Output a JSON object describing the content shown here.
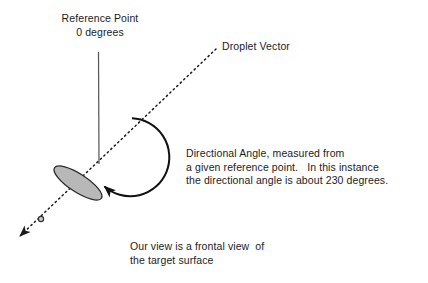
{
  "figure": {
    "title_text_blocks": {
      "reference_point": "Reference Point\n0 degrees",
      "droplet_vector": "Droplet Vector",
      "directional_angle": "Directional Angle, measured from\na given reference point.   In this instance\nthe directional angle is about 230 degrees.",
      "frontal_view": "Our view is a frontal view  of\nthe target surface"
    },
    "values": {
      "reference_angle_degrees": "0",
      "directional_angle_degrees": "230"
    },
    "colors": {
      "stroke": "#1c1c1c",
      "reference_line": "#555555",
      "ellipse_fill": "#b8b8b8",
      "ellipse_stroke": "#2a2a2a",
      "background": "#ffffff",
      "text": "#1c1c1c"
    },
    "geometry": {
      "origin_x": 99,
      "origin_y": 164,
      "reference_line_top_y": 52,
      "arc_center_x": 137,
      "arc_center_y": 157,
      "arc_radius": 39,
      "arc_start_deg": -96,
      "arc_sweep_deg": 316,
      "vector_tip_x": 216,
      "vector_tip_y": 49,
      "vector_arrow_x": 14,
      "vector_arrow_y": 241,
      "ellipse_cx": 78,
      "ellipse_cy": 183,
      "ellipse_rx": 9,
      "ellipse_ry": 28,
      "ellipse_rotation_deg": -57
    }
  }
}
